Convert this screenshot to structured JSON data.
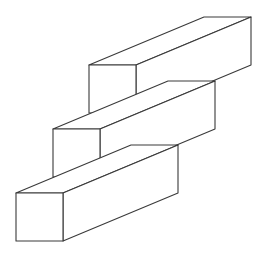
{
  "figure": {
    "stroke_color": "#3a3a3a",
    "background": "#ffffff",
    "depth_offset": [
      115,
      -48
    ],
    "prisms": [
      {
        "name": "top",
        "front": {
          "x": 89,
          "y": 65,
          "w": 47,
          "h": 48
        }
      },
      {
        "name": "middle",
        "front": {
          "x": 53,
          "y": 129,
          "w": 47,
          "h": 48
        }
      },
      {
        "name": "bottom",
        "front": {
          "x": 16,
          "y": 193,
          "w": 47,
          "h": 48
        }
      }
    ]
  }
}
